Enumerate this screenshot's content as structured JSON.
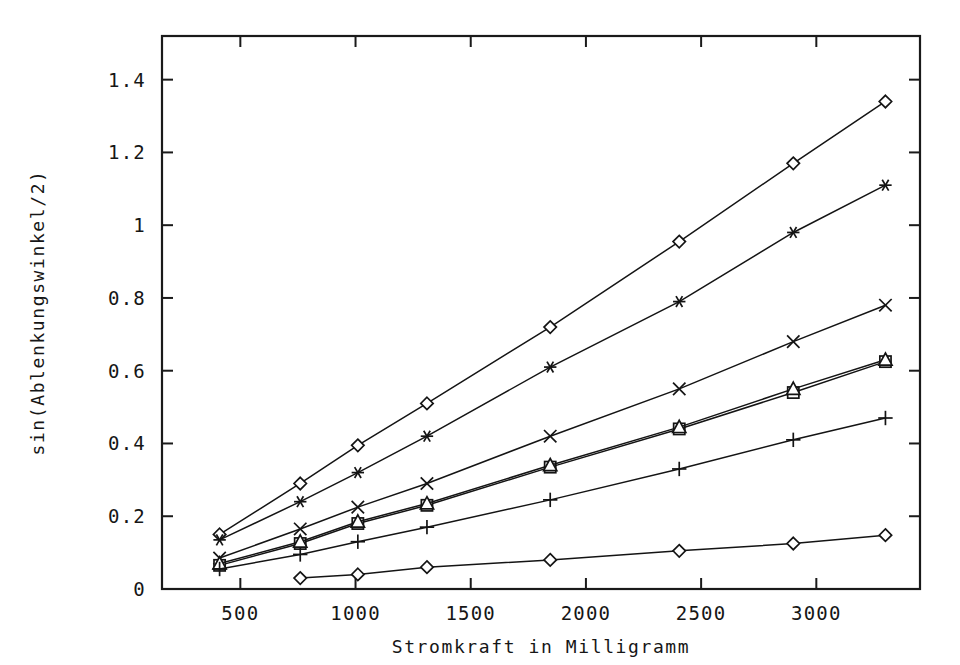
{
  "chart_data": {
    "type": "line",
    "title": "",
    "xlabel": "Stromkraft in Milligramm",
    "ylabel": "sin(Ablenkungswinkel/2)",
    "xlim": [
      160,
      3450
    ],
    "ylim": [
      0,
      1.52
    ],
    "grid": false,
    "legend": "none",
    "xticks": [
      500,
      1000,
      1500,
      2000,
      2500,
      3000
    ],
    "xticklabels": [
      "500",
      "1000",
      "1500",
      "2000",
      "2500",
      "3000"
    ],
    "yticks": [
      0,
      0.2,
      0.4,
      0.6,
      0.8,
      1,
      1.2,
      1.4
    ],
    "yticklabels": [
      "0",
      "0.2",
      "0.4",
      "0.6",
      "0.8",
      "1",
      "1.2",
      "1.4"
    ],
    "series": [
      {
        "name": "series-1-diamond-steep",
        "marker": "diamond",
        "x": [
          410,
          760,
          1010,
          1310,
          1845,
          2405,
          2900,
          3300
        ],
        "y": [
          0.15,
          0.29,
          0.395,
          0.51,
          0.72,
          0.955,
          1.17,
          1.34
        ]
      },
      {
        "name": "series-2-star",
        "marker": "star",
        "x": [
          410,
          760,
          1010,
          1310,
          1845,
          2405,
          2900,
          3300
        ],
        "y": [
          0.135,
          0.24,
          0.32,
          0.42,
          0.61,
          0.79,
          0.98,
          1.11
        ]
      },
      {
        "name": "series-3-cross",
        "marker": "cross",
        "x": [
          410,
          760,
          1010,
          1310,
          1845,
          2405,
          2900,
          3300
        ],
        "y": [
          0.085,
          0.165,
          0.225,
          0.29,
          0.42,
          0.55,
          0.68,
          0.78
        ]
      },
      {
        "name": "series-4-square",
        "marker": "square",
        "x": [
          410,
          760,
          1010,
          1310,
          1845,
          2405,
          2900,
          3300
        ],
        "y": [
          0.065,
          0.125,
          0.18,
          0.23,
          0.335,
          0.44,
          0.54,
          0.625
        ]
      },
      {
        "name": "series-5-triangle",
        "marker": "triangle",
        "x": [
          410,
          760,
          1010,
          1310,
          1845,
          2405,
          2900,
          3300
        ],
        "y": [
          0.07,
          0.13,
          0.185,
          0.235,
          0.34,
          0.445,
          0.55,
          0.63
        ]
      },
      {
        "name": "series-6-plus",
        "marker": "plus",
        "x": [
          410,
          760,
          1010,
          1310,
          1845,
          2405,
          2900,
          3300
        ],
        "y": [
          0.055,
          0.095,
          0.13,
          0.17,
          0.245,
          0.33,
          0.41,
          0.47
        ]
      },
      {
        "name": "series-7-diamond-shallow",
        "marker": "diamond",
        "x": [
          760,
          1010,
          1310,
          1845,
          2405,
          2900,
          3300
        ],
        "y": [
          0.03,
          0.04,
          0.06,
          0.08,
          0.105,
          0.125,
          0.148
        ]
      }
    ]
  },
  "axes": {
    "xlabel": "Stromkraft in Milligramm",
    "ylabel": "sin(Ablenkungswinkel/2)"
  }
}
